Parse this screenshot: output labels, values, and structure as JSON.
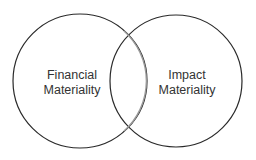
{
  "diagram": {
    "type": "venn",
    "sets": [
      {
        "line1": "Financial",
        "line2": "Materiality"
      },
      {
        "line1": "Impact",
        "line2": "Materiality"
      }
    ],
    "colors": {
      "stroke": "#2a2a2a",
      "overlap_stroke": "#8a8a8a",
      "background": "#ffffff",
      "text": "#333333"
    }
  }
}
